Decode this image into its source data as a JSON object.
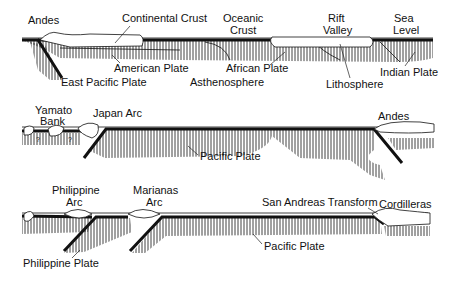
{
  "diagram": {
    "colors": {
      "ink": "#111111",
      "background": "#ffffff"
    },
    "panels": [
      {
        "id": "top",
        "labels": {
          "andes": "Andes",
          "continental_crust": "Continental Crust",
          "oceanic_crust_1": "Oceanic",
          "oceanic_crust_2": "Crust",
          "rift_valley_1": "Rift",
          "rift_valley_2": "Valley",
          "sea_level_1": "Sea",
          "sea_level_2": "Level",
          "american_plate": "American Plate",
          "east_pacific_plate": "East Pacific Plate",
          "african_plate": "African Plate",
          "asthenosphere": "Asthenosphere",
          "lithosphere": "Lithosphere",
          "indian_plate": "Indian Plate"
        }
      },
      {
        "id": "middle",
        "labels": {
          "yamato_bank_1": "Yamato",
          "yamato_bank_2": "Bank",
          "japan_arc": "Japan Arc",
          "pacific_plate": "Pacific Plate",
          "andes": "Andes",
          "unknown_mark": "?"
        }
      },
      {
        "id": "bottom",
        "labels": {
          "philippine_arc_1": "Philippine",
          "philippine_arc_2": "Arc",
          "marianas_arc_1": "Marianas",
          "marianas_arc_2": "Arc",
          "san_andreas": "San Andreas Transform",
          "cordilleras": "Cordilleras",
          "pacific_plate": "Pacific Plate",
          "philippine_plate": "Philippine Plate"
        }
      }
    ]
  }
}
